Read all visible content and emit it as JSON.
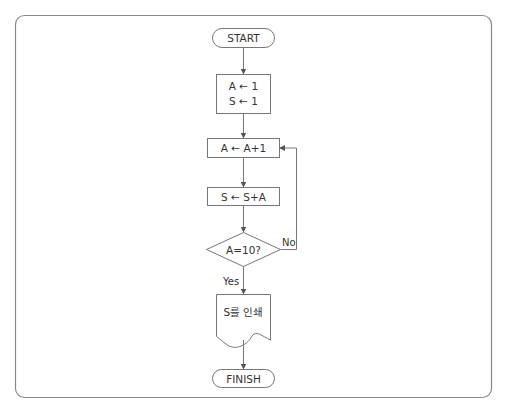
{
  "diagram": {
    "type": "flowchart",
    "colors": {
      "stroke": "#777777",
      "text": "#333333",
      "background": "#ffffff"
    },
    "nodes": [
      {
        "id": "start",
        "shape": "terminal",
        "label": "START"
      },
      {
        "id": "init",
        "shape": "process",
        "lines": [
          "A ← 1",
          "S ← 1"
        ]
      },
      {
        "id": "inc",
        "shape": "process",
        "label": "A ← A+1"
      },
      {
        "id": "sum",
        "shape": "process",
        "label": "S ← S+A"
      },
      {
        "id": "cond",
        "shape": "decision",
        "label": "A=10?"
      },
      {
        "id": "print",
        "shape": "document",
        "label": "S를 인쇄"
      },
      {
        "id": "finish",
        "shape": "terminal",
        "label": "FINISH"
      }
    ],
    "edges": [
      {
        "from": "start",
        "to": "init"
      },
      {
        "from": "init",
        "to": "inc"
      },
      {
        "from": "inc",
        "to": "sum"
      },
      {
        "from": "sum",
        "to": "cond"
      },
      {
        "from": "cond",
        "to": "inc",
        "label": "No"
      },
      {
        "from": "cond",
        "to": "print",
        "label": "Yes"
      },
      {
        "from": "print",
        "to": "finish"
      }
    ]
  }
}
